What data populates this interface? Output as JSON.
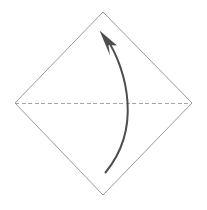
{
  "diagram": {
    "title": "Origami valley fold step",
    "background_color": "#ffffff",
    "width": 207,
    "height": 210,
    "shapes": {
      "paper": {
        "name": "square-sheet-diamond",
        "kind": "polygon",
        "stroke_color": "#9a9a9a",
        "stroke_width": 1,
        "fill": "none",
        "points": "103,12 192,103 103,195 15,103",
        "vertices": {
          "top": {
            "x": 103,
            "y": 12
          },
          "right": {
            "x": 192,
            "y": 103
          },
          "bottom": {
            "x": 103,
            "y": 195
          },
          "left": {
            "x": 15,
            "y": 103
          }
        }
      },
      "fold_line": {
        "name": "horizontal-fold-crease",
        "kind": "dashed-line",
        "stroke_color": "#a5a5a5",
        "stroke_width": 1,
        "dash_pattern": "4 2.5",
        "x1": 15,
        "y1": 103,
        "x2": 192,
        "y2": 103
      },
      "fold_arrow": {
        "name": "fold-direction-arrow",
        "kind": "curved-arrow",
        "stroke_color": "#4e4e4e",
        "stroke_width": 2,
        "path": "M 105.5,172.5 C 124,150 129,124 127.5,102 C 126,78 117,54 106.5,38.5",
        "start": {
          "x": 105.5,
          "y": 172.5
        },
        "end": {
          "x": 106.5,
          "y": 38.5
        },
        "bulge_x": 128,
        "arrowhead": {
          "name": "arrow-tip",
          "fill_color": "#4e4e4e",
          "tip": {
            "x": 99.5,
            "y": 30.5
          },
          "points": "99.5,30.5 117,45.5 108.5,45 110,55.5"
        }
      }
    }
  }
}
